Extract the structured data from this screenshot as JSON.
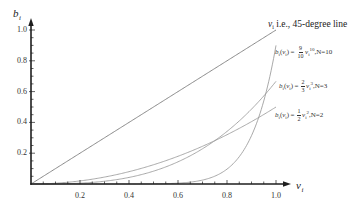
{
  "chart_data": {
    "type": "line",
    "title": "",
    "xlabel": "v_i",
    "ylabel": "b_i",
    "xlim": [
      0,
      1.0
    ],
    "ylim": [
      0,
      1.0
    ],
    "grid": false,
    "legend": "inline labels at right end of each curve",
    "x_ticks": [
      0.2,
      0.4,
      0.6,
      0.8,
      1.0
    ],
    "x_tick_labels": [
      "0.2",
      "0.4",
      "0.6",
      "0.8",
      "1.0"
    ],
    "y_ticks": [
      0.2,
      0.4,
      0.6,
      0.8,
      1.0
    ],
    "y_tick_labels": [
      "0.2",
      "0.4",
      "0.6",
      "0.8",
      "1.0"
    ],
    "minor_tick_step": 0.05,
    "x": [
      0,
      0.1,
      0.2,
      0.3,
      0.4,
      0.5,
      0.6,
      0.7,
      0.8,
      0.9,
      1.0
    ],
    "series": [
      {
        "name": "v_i i.e., 45-degree line",
        "key": "line45",
        "coefficient": 1,
        "exponent": 1,
        "values": [
          0,
          0.1,
          0.2,
          0.3,
          0.4,
          0.5,
          0.6,
          0.7,
          0.8,
          0.9,
          1.0
        ]
      },
      {
        "name": "b_i(v_i) = 9/10 v_i^10, N=10",
        "key": "n10",
        "coefficient": 0.9,
        "exponent": 10,
        "values": [
          0,
          0,
          0,
          0,
          0.0001,
          0.0009,
          0.0054,
          0.0254,
          0.0966,
          0.3138,
          0.9
        ]
      },
      {
        "name": "b_i(v_i) = 2/3 v_i^3, N=3",
        "key": "n3",
        "coefficient": 0.6667,
        "exponent": 3,
        "values": [
          0,
          0.0007,
          0.0053,
          0.018,
          0.0427,
          0.0833,
          0.144,
          0.2287,
          0.3413,
          0.486,
          0.6667
        ]
      },
      {
        "name": "b_i(v_i) = 1/2 v_i^2, N=2",
        "key": "n2",
        "coefficient": 0.5,
        "exponent": 2,
        "values": [
          0,
          0.005,
          0.02,
          0.045,
          0.08,
          0.125,
          0.18,
          0.245,
          0.32,
          0.405,
          0.5
        ]
      }
    ]
  },
  "axes": {
    "y_label": {
      "var": "b",
      "sub": "i"
    },
    "x_label": {
      "var": "v",
      "sub": "i"
    }
  },
  "annotations": {
    "line45": {
      "var": "v",
      "sub": "i",
      "text": "i.e., 45-degree line"
    },
    "n10": {
      "b": "b",
      "i": "i",
      "open": "(",
      "v": "v",
      "close": ")",
      "eq": "=",
      "num": "9",
      "den": "10",
      "exp": "10",
      "suffix": ",N=10"
    },
    "n3": {
      "b": "b",
      "i": "i",
      "open": "(",
      "v": "v",
      "close": ")",
      "eq": "=",
      "num": "2",
      "den": "3",
      "exp": "3",
      "suffix": ",N=3"
    },
    "n2": {
      "b": "b",
      "i": "i",
      "open": "(",
      "v": "v",
      "close": ")",
      "eq": "=",
      "num": "1",
      "den": "2",
      "exp": "2",
      "suffix": ",N=2"
    }
  },
  "colors": {
    "axis": "#1e1e1e",
    "curve": "#9a9a9a",
    "line45": "#7c7c7c",
    "text": "#2a2a2a"
  }
}
